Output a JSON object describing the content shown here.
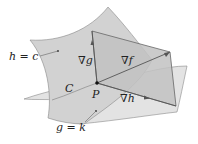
{
  "figure": {
    "type": "diagram",
    "labels": {
      "surface_h": "h = c",
      "surface_g": "g = k",
      "curve": "C",
      "point": "P",
      "grad_g": "∇g",
      "grad_f": "∇f",
      "grad_h": "∇h"
    },
    "colors": {
      "surface_fill": "#d4d4d4",
      "surface_fill_light": "#e2e2e2",
      "plane_fill": "#bdbdbd",
      "line": "#6a6a6a",
      "text": "#222222"
    }
  }
}
